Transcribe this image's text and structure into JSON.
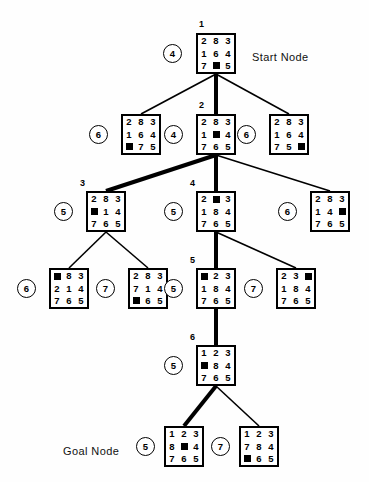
{
  "figure": {
    "background": "#ffffff",
    "ink": "#000000"
  },
  "annotations": [
    {
      "id": "start-label",
      "text": "Start Node",
      "x": 252,
      "y": 52
    },
    {
      "id": "goal-label",
      "text": "Goal Node",
      "x": 63,
      "y": 446
    }
  ],
  "nodes": [
    {
      "id": "n1",
      "order": "1",
      "cost": "4",
      "tiles": [
        "2",
        "8",
        "3",
        "1",
        "6",
        "4",
        "7",
        "",
        "5"
      ],
      "box": {
        "x": 196,
        "y": 33
      },
      "cost_pos": {
        "x": 163,
        "y": 44
      },
      "order_pos": {
        "x": 199,
        "y": 20
      }
    },
    {
      "id": "n2a",
      "order": "",
      "cost": "6",
      "tiles": [
        "2",
        "8",
        "3",
        "1",
        "6",
        "4",
        "",
        "7",
        "5"
      ],
      "box": {
        "x": 121,
        "y": 114
      },
      "cost_pos": {
        "x": 89,
        "y": 125
      },
      "order_pos": null
    },
    {
      "id": "n2",
      "order": "2",
      "cost": "4",
      "tiles": [
        "2",
        "8",
        "3",
        "1",
        "",
        "4",
        "7",
        "6",
        "5"
      ],
      "box": {
        "x": 196,
        "y": 114
      },
      "cost_pos": {
        "x": 164,
        "y": 125
      },
      "order_pos": {
        "x": 199,
        "y": 101
      }
    },
    {
      "id": "n2c",
      "order": "",
      "cost": "6",
      "tiles": [
        "2",
        "8",
        "3",
        "1",
        "6",
        "4",
        "7",
        "5",
        ""
      ],
      "box": {
        "x": 269,
        "y": 114
      },
      "cost_pos": {
        "x": 237,
        "y": 125
      },
      "order_pos": null
    },
    {
      "id": "n3",
      "order": "3",
      "cost": "5",
      "tiles": [
        "2",
        "8",
        "3",
        "",
        "1",
        "4",
        "7",
        "6",
        "5"
      ],
      "box": {
        "x": 86,
        "y": 191
      },
      "cost_pos": {
        "x": 54,
        "y": 202
      },
      "order_pos": {
        "x": 80,
        "y": 179
      }
    },
    {
      "id": "n4",
      "order": "4",
      "cost": "5",
      "tiles": [
        "2",
        "",
        "3",
        "1",
        "8",
        "4",
        "7",
        "6",
        "5"
      ],
      "box": {
        "x": 196,
        "y": 191
      },
      "cost_pos": {
        "x": 164,
        "y": 202
      },
      "order_pos": {
        "x": 190,
        "y": 179
      }
    },
    {
      "id": "n4c",
      "order": "",
      "cost": "6",
      "tiles": [
        "2",
        "8",
        "3",
        "1",
        "4",
        "",
        "7",
        "6",
        "5"
      ],
      "box": {
        "x": 310,
        "y": 191
      },
      "cost_pos": {
        "x": 278,
        "y": 202
      },
      "order_pos": null
    },
    {
      "id": "n5a",
      "order": "",
      "cost": "6",
      "tiles": [
        "",
        "8",
        "3",
        "2",
        "1",
        "4",
        "7",
        "6",
        "5"
      ],
      "box": {
        "x": 49,
        "y": 268
      },
      "cost_pos": {
        "x": 17,
        "y": 279
      },
      "order_pos": null
    },
    {
      "id": "n5b",
      "order": "",
      "cost": "7",
      "tiles": [
        "2",
        "8",
        "3",
        "7",
        "1",
        "4",
        "",
        "6",
        "5"
      ],
      "box": {
        "x": 128,
        "y": 268
      },
      "cost_pos": {
        "x": 96,
        "y": 279
      },
      "order_pos": null
    },
    {
      "id": "n5",
      "order": "5",
      "cost": "5",
      "tiles": [
        "",
        "2",
        "3",
        "1",
        "8",
        "4",
        "7",
        "6",
        "5"
      ],
      "box": {
        "x": 196,
        "y": 268
      },
      "cost_pos": {
        "x": 164,
        "y": 279
      },
      "order_pos": {
        "x": 190,
        "y": 256
      }
    },
    {
      "id": "n5d",
      "order": "",
      "cost": "7",
      "tiles": [
        "2",
        "3",
        "",
        "1",
        "8",
        "4",
        "7",
        "6",
        "5"
      ],
      "box": {
        "x": 276,
        "y": 268
      },
      "cost_pos": {
        "x": 244,
        "y": 279
      },
      "order_pos": null
    },
    {
      "id": "n6",
      "order": "6",
      "cost": "5",
      "tiles": [
        "1",
        "2",
        "3",
        "",
        "8",
        "4",
        "7",
        "6",
        "5"
      ],
      "box": {
        "x": 196,
        "y": 345
      },
      "cost_pos": {
        "x": 164,
        "y": 356
      },
      "order_pos": {
        "x": 190,
        "y": 333
      }
    },
    {
      "id": "n7goal",
      "order": "",
      "cost": "5",
      "tiles": [
        "1",
        "2",
        "3",
        "8",
        "",
        "4",
        "7",
        "6",
        "5"
      ],
      "box": {
        "x": 164,
        "y": 426
      },
      "cost_pos": {
        "x": 136,
        "y": 437
      },
      "order_pos": null
    },
    {
      "id": "n7b",
      "order": "",
      "cost": "7",
      "tiles": [
        "1",
        "2",
        "3",
        "7",
        "8",
        "4",
        "",
        "6",
        "5"
      ],
      "box": {
        "x": 239,
        "y": 426
      },
      "cost_pos": {
        "x": 211,
        "y": 437
      },
      "order_pos": null
    }
  ],
  "edges": [
    {
      "from": "n1",
      "to": "n2a",
      "weight": "thin"
    },
    {
      "from": "n1",
      "to": "n2",
      "weight": "thick"
    },
    {
      "from": "n1",
      "to": "n2c",
      "weight": "thin"
    },
    {
      "from": "n2",
      "to": "n3",
      "weight": "thick"
    },
    {
      "from": "n2",
      "to": "n4",
      "weight": "thick"
    },
    {
      "from": "n2",
      "to": "n4c",
      "weight": "thin"
    },
    {
      "from": "n3",
      "to": "n5a",
      "weight": "thin"
    },
    {
      "from": "n3",
      "to": "n5b",
      "weight": "thin"
    },
    {
      "from": "n4",
      "to": "n5",
      "weight": "thick"
    },
    {
      "from": "n4",
      "to": "n5d",
      "weight": "thin"
    },
    {
      "from": "n5",
      "to": "n6",
      "weight": "thick"
    },
    {
      "from": "n6",
      "to": "n7goal",
      "weight": "thick"
    },
    {
      "from": "n6",
      "to": "n7b",
      "weight": "thin"
    }
  ]
}
